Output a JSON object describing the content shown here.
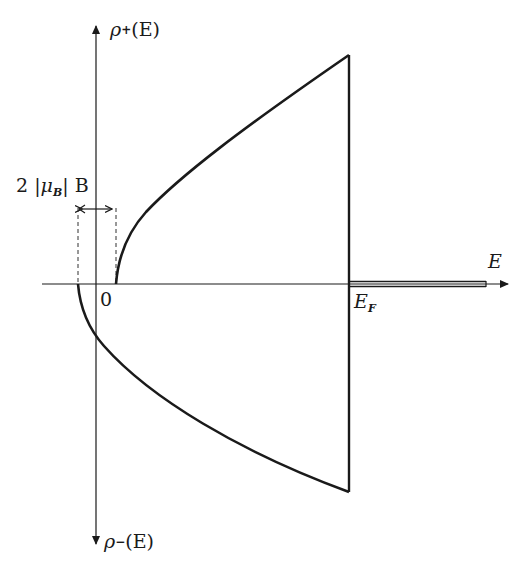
{
  "diagram": {
    "axes": {
      "x_label": "E",
      "y_top_label": {
        "symbol": "ρ",
        "subscript": "+",
        "arg": "(E)"
      },
      "y_bottom_label": {
        "symbol": "ρ",
        "subscript": "−",
        "arg": "(E)"
      }
    },
    "labels": {
      "origin": "0",
      "fermi": {
        "symbol": "E",
        "subscript": "F"
      },
      "splitting": {
        "prefix": "2 |",
        "mu": "μ",
        "mu_sub": "B",
        "suffix": "| B"
      }
    },
    "curves": [
      {
        "name": "rho-plus",
        "description": "√(E − |μB|B) branch, starts at +|μB|B, rises until E_F then drops to zero"
      },
      {
        "name": "rho-minus",
        "description": "√(E + |μB|B) branch, starts at −|μB|B, plotted downward until E_F"
      }
    ],
    "colors": {
      "ink": "#1a1a1a",
      "background": "#ffffff"
    }
  }
}
